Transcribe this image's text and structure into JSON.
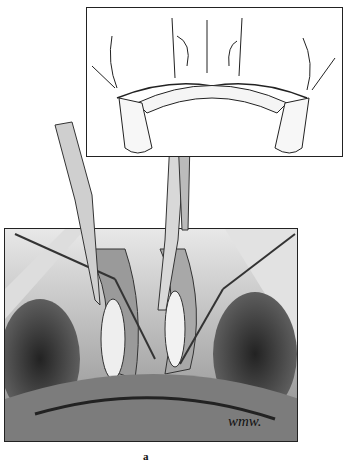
{
  "figure": {
    "panel_label": "a",
    "artist_signature": "wmw.",
    "inset": {
      "description": "schematic cross-section of palatal/alveolar bone with teeth roots"
    },
    "main": {
      "description": "surgical field illustration with retractors and instruments"
    }
  }
}
